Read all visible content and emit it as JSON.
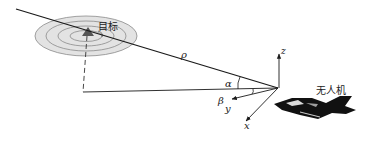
{
  "diagram": {
    "type": "geometry",
    "labels": {
      "target": "目标",
      "uav": "无人机",
      "range": "ρ",
      "alpha": "α",
      "beta": "β",
      "axis_x": "x",
      "axis_y": "y",
      "axis_z": "z"
    },
    "icons": {
      "target": "triangle-target-icon",
      "uav": "jet-aircraft-icon"
    },
    "colors": {
      "line": "#1a1a1a",
      "ring_fill": "#dcdcdc",
      "ring_stroke": "#8a8a8a",
      "aircraft": "#111111",
      "background": "#ffffff"
    },
    "rings": 4
  }
}
